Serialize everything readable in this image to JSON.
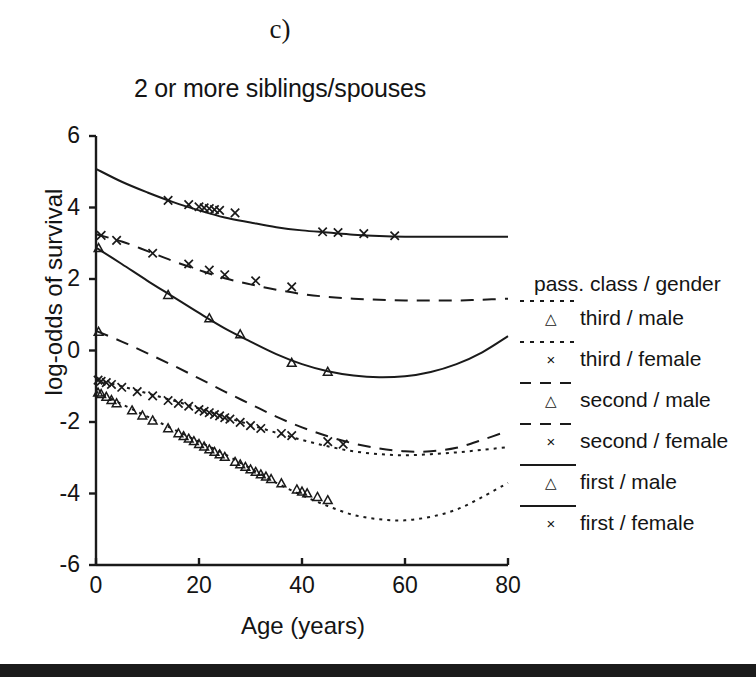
{
  "panel": {
    "label": "c)"
  },
  "chart_data": {
    "type": "line",
    "title": "2 or more siblings/spouses",
    "xlabel": "Age (years)",
    "ylabel": "log-odds of survival",
    "xlim": [
      0,
      80
    ],
    "ylim": [
      -6,
      6
    ],
    "xticks": [
      0,
      20,
      40,
      60,
      80
    ],
    "yticks": [
      6,
      4,
      2,
      0,
      -2,
      -4,
      -6
    ],
    "grid": false,
    "legend_position": "right",
    "legend_title": "pass. class / gender",
    "series": [
      {
        "name": "third / male",
        "linestyle": "dotted",
        "marker": "triangle",
        "x": [
          0,
          5,
          10,
          15,
          20,
          25,
          30,
          35,
          40,
          45,
          50,
          55,
          60,
          65,
          70,
          75,
          80
        ],
        "y": [
          -1.15,
          -1.5,
          -1.85,
          -2.2,
          -2.55,
          -2.9,
          -3.3,
          -3.7,
          -4.05,
          -4.35,
          -4.6,
          -4.72,
          -4.75,
          -4.65,
          -4.45,
          -4.1,
          -3.7
        ],
        "data_points": {
          "x": [
            0.4,
            1,
            2,
            3,
            4,
            7,
            9,
            11,
            14,
            16,
            17,
            18,
            19,
            20,
            21,
            22,
            23,
            24,
            25,
            27,
            28,
            29,
            30,
            31,
            32,
            33,
            34,
            36,
            39,
            40,
            41,
            43,
            45
          ],
          "y": [
            -1.18,
            -1.22,
            -1.3,
            -1.39,
            -1.48,
            -1.68,
            -1.82,
            -1.96,
            -2.18,
            -2.32,
            -2.4,
            -2.47,
            -2.54,
            -2.62,
            -2.69,
            -2.77,
            -2.84,
            -2.91,
            -2.98,
            -3.12,
            -3.19,
            -3.26,
            -3.33,
            -3.4,
            -3.47,
            -3.53,
            -3.6,
            -3.72,
            -3.89,
            -3.95,
            -4.0,
            -4.1,
            -4.19
          ]
        }
      },
      {
        "name": "third / female",
        "linestyle": "dotted",
        "marker": "cross",
        "x": [
          0,
          5,
          10,
          15,
          20,
          25,
          30,
          35,
          40,
          45,
          50,
          55,
          60,
          65,
          70,
          75,
          80
        ],
        "y": [
          -0.82,
          -1.0,
          -1.2,
          -1.4,
          -1.62,
          -1.85,
          -2.08,
          -2.3,
          -2.5,
          -2.68,
          -2.82,
          -2.9,
          -2.93,
          -2.9,
          -2.85,
          -2.78,
          -2.7
        ],
        "data_points": {
          "x": [
            0.4,
            1,
            2,
            3,
            5,
            8,
            11,
            14,
            16,
            18,
            20,
            21,
            22,
            23,
            24,
            25,
            26,
            28,
            30,
            32,
            36,
            38,
            45,
            48
          ],
          "y": [
            -0.83,
            -0.86,
            -0.9,
            -0.95,
            -1.03,
            -1.15,
            -1.27,
            -1.4,
            -1.48,
            -1.56,
            -1.65,
            -1.7,
            -1.74,
            -1.79,
            -1.83,
            -1.88,
            -1.92,
            -2.01,
            -2.1,
            -2.18,
            -2.32,
            -2.38,
            -2.55,
            -2.62
          ]
        }
      },
      {
        "name": "second / male",
        "linestyle": "dashed",
        "marker": "triangle",
        "x": [
          0,
          5,
          10,
          15,
          20,
          25,
          30,
          35,
          40,
          45,
          50,
          55,
          60,
          65,
          70,
          75,
          80
        ],
        "y": [
          0.55,
          0.25,
          -0.08,
          -0.42,
          -0.78,
          -1.15,
          -1.5,
          -1.85,
          -2.15,
          -2.4,
          -2.6,
          -2.74,
          -2.82,
          -2.82,
          -2.72,
          -2.5,
          -2.25
        ],
        "data_points": {
          "x": [
            0.5
          ],
          "y": [
            0.52
          ]
        }
      },
      {
        "name": "second / female",
        "linestyle": "dashed",
        "marker": "cross",
        "x": [
          0,
          5,
          10,
          15,
          20,
          25,
          30,
          35,
          40,
          45,
          50,
          55,
          60,
          65,
          70,
          75,
          80
        ],
        "y": [
          3.25,
          3.05,
          2.78,
          2.5,
          2.25,
          2.02,
          1.85,
          1.7,
          1.58,
          1.5,
          1.45,
          1.42,
          1.4,
          1.4,
          1.4,
          1.42,
          1.45
        ],
        "data_points": {
          "x": [
            1,
            4,
            11,
            18,
            22,
            25,
            31,
            38
          ],
          "y": [
            3.22,
            3.08,
            2.72,
            2.42,
            2.25,
            2.12,
            1.95,
            1.78
          ]
        }
      },
      {
        "name": "first / male",
        "linestyle": "solid",
        "marker": "triangle",
        "x": [
          0,
          5,
          10,
          15,
          20,
          25,
          30,
          35,
          40,
          45,
          50,
          55,
          60,
          65,
          70,
          75,
          80
        ],
        "y": [
          2.88,
          2.42,
          1.95,
          1.5,
          1.05,
          0.62,
          0.25,
          -0.1,
          -0.38,
          -0.58,
          -0.7,
          -0.75,
          -0.72,
          -0.6,
          -0.38,
          -0.05,
          0.4
        ],
        "data_points": {
          "x": [
            0.5,
            14,
            22,
            28,
            38,
            45
          ],
          "y": [
            2.86,
            1.55,
            0.9,
            0.45,
            -0.35,
            -0.6
          ]
        }
      },
      {
        "name": "first / female",
        "linestyle": "solid",
        "marker": "cross",
        "x": [
          0,
          5,
          10,
          15,
          20,
          25,
          30,
          35,
          40,
          45,
          50,
          55,
          60,
          65,
          70,
          75,
          80
        ],
        "y": [
          5.08,
          4.72,
          4.42,
          4.15,
          3.92,
          3.72,
          3.58,
          3.45,
          3.36,
          3.3,
          3.24,
          3.2,
          3.18,
          3.18,
          3.18,
          3.18,
          3.18
        ],
        "data_points": {
          "x": [
            14,
            18,
            20,
            21,
            22,
            23,
            24,
            27,
            44,
            47,
            52,
            58
          ],
          "y": [
            4.2,
            4.08,
            4.02,
            3.99,
            3.97,
            3.94,
            3.92,
            3.85,
            3.32,
            3.3,
            3.27,
            3.21
          ]
        }
      }
    ]
  },
  "legend": {
    "title": "pass. class / gender",
    "items": [
      {
        "label": "third / male",
        "marker": "triangle-marker",
        "line": "dotted"
      },
      {
        "label": "third / female",
        "marker": "cross-marker",
        "line": "dotted"
      },
      {
        "label": "second / male",
        "marker": "triangle-marker",
        "line": "dashed"
      },
      {
        "label": "second / female",
        "marker": "cross-marker",
        "line": "dashed"
      },
      {
        "label": "first / male",
        "marker": "triangle-marker",
        "line": "solid"
      },
      {
        "label": "first / female",
        "marker": "cross-marker",
        "line": "solid"
      }
    ],
    "marker_glyphs": {
      "triangle-marker": "△",
      "cross-marker": "×"
    }
  },
  "style": {
    "ink": "#1a1a1a",
    "background": "#ffffff",
    "footer_bar": "#1b1b1b"
  }
}
